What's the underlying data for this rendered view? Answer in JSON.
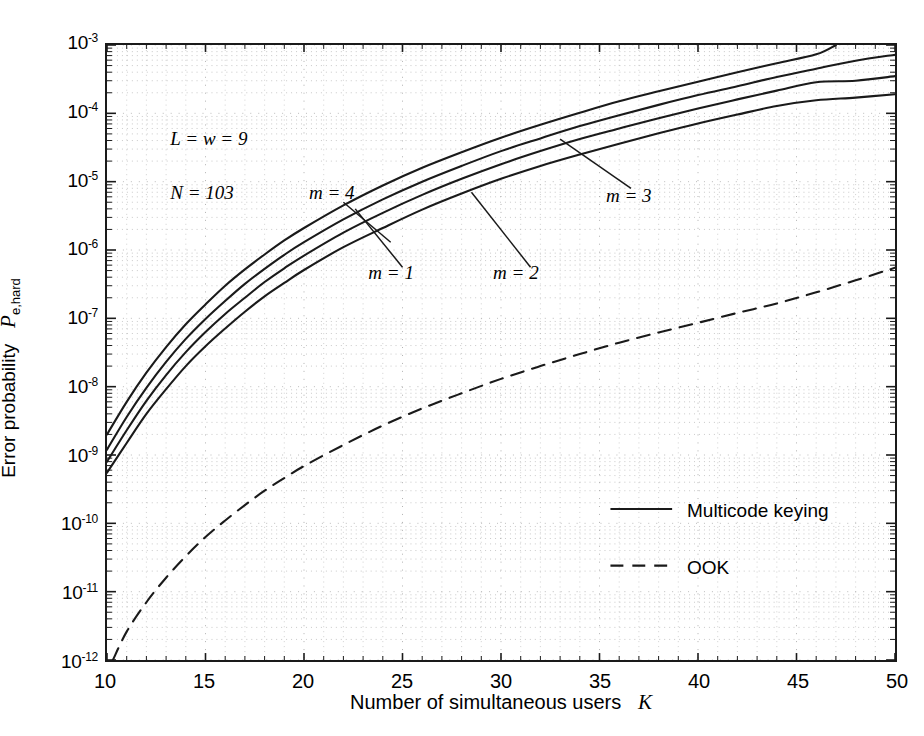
{
  "chart_data": {
    "type": "line",
    "title": "",
    "xlabel": "Number of simultaneous users   K",
    "xlabel_text": "Number of simultaneous users",
    "xlabel_symbol": "K",
    "ylabel": "Error probability  P e,hard",
    "ylabel_text": "Error probability",
    "ylabel_symbol": "P",
    "ylabel_subscript": "e,hard",
    "xscale": "linear",
    "yscale": "log",
    "xlim": [
      10,
      50
    ],
    "ylim": [
      1e-12,
      0.001
    ],
    "xticks": [
      10,
      15,
      20,
      25,
      30,
      35,
      40,
      45,
      50
    ],
    "xticklabels": [
      "10",
      "15",
      "20",
      "25",
      "30",
      "35",
      "40",
      "45",
      "50"
    ],
    "yticks": [
      0.001,
      0.0001,
      1e-05,
      1e-06,
      1e-07,
      1e-08,
      1e-09,
      1e-10,
      1e-11,
      1e-12
    ],
    "yticklabels": [
      "10-3",
      "10-4",
      "10-5",
      "10-6",
      "10-7",
      "10-8",
      "10-9",
      "10-10",
      "10-11",
      "10-12"
    ],
    "ytick_exponents": [
      "-3",
      "-4",
      "-5",
      "-6",
      "-7",
      "-8",
      "-9",
      "-10",
      "-11",
      "-12"
    ],
    "grid": "minor-dotted-log",
    "grid_color": "#9a9a9a",
    "line_color": "#1a1a1a",
    "legend_position": "center-right",
    "series": [
      {
        "name": "m = 4",
        "style": "solid",
        "group": "Multicode keying",
        "x": [
          10,
          11,
          12,
          13,
          14,
          15,
          16,
          17,
          18,
          19,
          20,
          22,
          24,
          26,
          28,
          30,
          32,
          34,
          36,
          38,
          40,
          42,
          44,
          46,
          47
        ],
        "y": [
          2e-09,
          6e-09,
          1.6e-08,
          3.8e-08,
          8.2e-08,
          1.6e-07,
          3e-07,
          5.2e-07,
          8.6e-07,
          1.38e-06,
          2.1e-06,
          4.5e-06,
          8.8e-06,
          1.6e-05,
          2.7e-05,
          4.4e-05,
          6.8e-05,
          0.000102,
          0.00015,
          0.00021,
          0.00029,
          0.0004,
          0.00054,
          0.00073,
          0.001
        ]
      },
      {
        "name": "m = 3",
        "style": "solid",
        "group": "Multicode keying",
        "x": [
          10,
          11,
          12,
          13,
          14,
          15,
          16,
          17,
          18,
          19,
          20,
          22,
          24,
          26,
          28,
          30,
          32,
          34,
          36,
          38,
          40,
          42,
          44,
          46,
          48,
          50
        ],
        "y": [
          1.2e-09,
          3.6e-09,
          9.6e-09,
          2.3e-08,
          5e-08,
          9.8e-08,
          1.8e-07,
          3.2e-07,
          5.3e-07,
          8.5e-07,
          1.3e-06,
          2.8e-06,
          5.5e-06,
          1e-05,
          1.7e-05,
          2.8e-05,
          4.3e-05,
          6.5e-05,
          9.4e-05,
          0.000133,
          0.000185,
          0.00025,
          0.00034,
          0.00045,
          0.00059,
          0.00072
        ]
      },
      {
        "name": "m = 2",
        "style": "solid",
        "group": "Multicode keying",
        "x": [
          10,
          11,
          12,
          13,
          14,
          15,
          16,
          17,
          18,
          19,
          20,
          22,
          24,
          26,
          28,
          30,
          32,
          34,
          36,
          38,
          40,
          42,
          44,
          46,
          48,
          50
        ],
        "y": [
          8e-10,
          2.3e-09,
          6.2e-09,
          1.48e-08,
          3.2e-08,
          6.3e-08,
          1.16e-07,
          2e-07,
          3.4e-07,
          5.4e-07,
          8.3e-07,
          1.8e-06,
          3.5e-06,
          6.4e-06,
          1.1e-05,
          1.8e-05,
          2.8e-05,
          4.2e-05,
          6e-05,
          8.5e-05,
          0.000118,
          0.00016,
          0.000215,
          0.000285,
          0.0003,
          0.00035
        ]
      },
      {
        "name": "m = 1",
        "style": "solid",
        "group": "Multicode keying",
        "x": [
          10,
          11,
          12,
          13,
          14,
          15,
          16,
          17,
          18,
          19,
          20,
          22,
          24,
          26,
          28,
          30,
          32,
          34,
          36,
          38,
          40,
          42,
          44,
          46,
          48,
          50
        ],
        "y": [
          5.5e-10,
          1.5e-09,
          4e-09,
          9.2e-09,
          2e-08,
          3.9e-08,
          7.1e-08,
          1.25e-07,
          2.1e-07,
          3.3e-07,
          5.1e-07,
          1.1e-06,
          2.1e-06,
          3.9e-06,
          6.7e-06,
          1.1e-05,
          1.7e-05,
          2.5e-05,
          3.6e-05,
          5.1e-05,
          7.1e-05,
          9.6e-05,
          0.000128,
          0.000155,
          0.00017,
          0.00019
        ]
      },
      {
        "name": "OOK",
        "style": "dashed",
        "group": "OOK",
        "x": [
          10.3,
          11,
          12,
          13,
          14,
          15,
          16,
          17,
          18,
          19,
          20,
          22,
          24,
          26,
          28,
          30,
          32,
          34,
          36,
          38,
          40,
          42,
          44,
          46,
          48,
          50
        ],
        "y": [
          1e-12,
          2.6e-12,
          7e-12,
          1.6e-11,
          3.3e-11,
          6.3e-11,
          1.1e-10,
          1.85e-10,
          3e-10,
          4.6e-10,
          6.9e-10,
          1.4e-09,
          2.7e-09,
          4.8e-09,
          8e-09,
          1.3e-08,
          2e-08,
          3e-08,
          4.4e-08,
          6.2e-08,
          8.6e-08,
          1.2e-07,
          1.65e-07,
          2.4e-07,
          3.6e-07,
          5.5e-07
        ]
      }
    ],
    "annotations": [
      {
        "id": "param-L-w",
        "text": "L = w = 9",
        "x": 13.2,
        "y": 4e-05
      },
      {
        "id": "param-N",
        "text": "N = 103",
        "x": 13.2,
        "y": 6.5e-06
      },
      {
        "id": "label-m4",
        "text": "m = 4",
        "x": 20.2,
        "y": 6.5e-06
      },
      {
        "id": "label-m3",
        "text": "m = 3",
        "x": 35.2,
        "y": 6e-06
      },
      {
        "id": "label-m2",
        "text": "m = 2",
        "x": 29.5,
        "y": 4.6e-07
      },
      {
        "id": "label-m1",
        "text": "m = 1",
        "x": 23.2,
        "y": 4.6e-07
      }
    ],
    "legend": [
      {
        "label": "Multicode keying",
        "style": "solid"
      },
      {
        "label": "OOK",
        "style": "dashed"
      }
    ]
  }
}
